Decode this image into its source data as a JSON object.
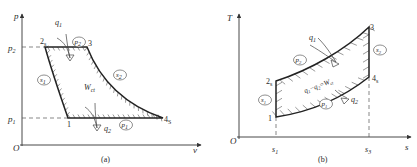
{
  "panel_a": {
    "caption": "(a)",
    "axis_y": "p",
    "axis_x": "v",
    "origin": "O",
    "p_high": {
      "main": "p",
      "sub": "2"
    },
    "p_low": {
      "main": "p",
      "sub": "1"
    },
    "points": {
      "p1": "1",
      "p2": {
        "main": "2",
        "sub": "s"
      },
      "p3": "3",
      "p4": {
        "main": "4",
        "sub": "S"
      }
    },
    "circled": {
      "high_isobar": {
        "main": "p",
        "sub": "2"
      },
      "low_isobar": {
        "main": "p",
        "sub": "1"
      },
      "compression_isentrope": {
        "main": "s",
        "sub": "1"
      },
      "expansion_isentrope": {
        "main": "s",
        "sub": "2"
      }
    },
    "heat_in": {
      "main": "q",
      "sub": "1"
    },
    "heat_out": {
      "main": "q",
      "sub": "2"
    },
    "work": {
      "main": "W",
      "sub": "ct"
    }
  },
  "panel_b": {
    "caption": "(b)",
    "axis_y": "T",
    "axis_x": "s",
    "origin": "O",
    "s_left": {
      "main": "s",
      "sub": "1"
    },
    "s_right": {
      "main": "s",
      "sub": "3"
    },
    "points": {
      "p1": "1",
      "p2": {
        "main": "2",
        "sub": "s"
      },
      "p3": "3",
      "p4": {
        "main": "4",
        "sub": "s"
      }
    },
    "circled": {
      "high_isobar": {
        "main": "p",
        "sub": "2"
      },
      "low_isobar": {
        "main": "p",
        "sub": "1"
      },
      "compression_isentrope": {
        "main": "s",
        "sub": "1"
      },
      "expansion_isentrope": {
        "main": "s",
        "sub": "2"
      }
    },
    "heat_in": {
      "main": "q",
      "sub": "1"
    },
    "heat_out": {
      "main": "q",
      "sub": "2"
    },
    "work_equation": {
      "a": "q",
      "a_sub": "1",
      "op": "−",
      "b": "q",
      "b_sub": "2",
      "eq": "=W",
      "eq_sub": "ct"
    }
  }
}
